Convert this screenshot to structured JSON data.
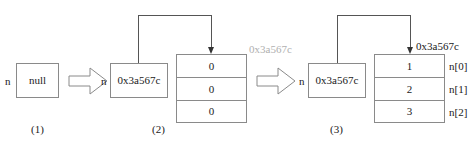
{
  "diagram": {
    "stages": [
      {
        "caption": "(1)",
        "pointer_label": "n",
        "pointer_value": "null"
      },
      {
        "caption": "(2)",
        "pointer_label": "n",
        "pointer_value": "0x3a567c",
        "heap_address_label": "0x3a567c",
        "cells": [
          "0",
          "0",
          "0"
        ],
        "index_labels": [
          "",
          "",
          ""
        ]
      },
      {
        "caption": "(3)",
        "pointer_label": "n",
        "pointer_value": "0x3a567c",
        "heap_address_label": "0x3a567c",
        "cells": [
          "1",
          "2",
          "3"
        ],
        "index_labels": [
          "n[0]",
          "n[1]",
          "n[2]"
        ]
      }
    ],
    "transitions": [
      {
        "name": "step-1-to-2"
      },
      {
        "name": "step-2-to-3"
      }
    ],
    "colors": {
      "stroke": "#8a8a8a",
      "connector": "#555555",
      "text": "#1a1a1a",
      "dim_text": "#b0b0b0",
      "background": "#ffffff"
    }
  }
}
